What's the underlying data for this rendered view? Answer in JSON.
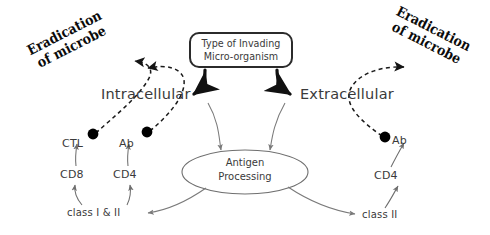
{
  "diagram": {
    "title_box": {
      "line1": "Type of Invading",
      "line2": "Micro-organism"
    },
    "branches": {
      "left_label": "Intracellular",
      "right_label": "Extracellular"
    },
    "processing_node": {
      "line1": "Antigen",
      "line2": "Processing"
    },
    "outcomes": {
      "left_line1": "Eradication",
      "left_line2": "of microbe",
      "right_line1": "Eradication",
      "right_line2": "of microbe"
    },
    "left_chain": {
      "effector_1": "CTL",
      "effector_2": "Ab",
      "receptor_1": "CD8",
      "receptor_2": "CD4",
      "mhc": "class I & II"
    },
    "right_chain": {
      "effector_1": "Ab",
      "receptor_1": "CD4",
      "mhc": "class II"
    },
    "colors": {
      "ink": "#3a3a3a",
      "bold_ink": "#0b0b0b",
      "thin_arrow": "#7a7a7a",
      "thick_arrow": "#111111",
      "dashed_arrow": "#1a1a1a",
      "dot": "#000000",
      "background": "#ffffff"
    }
  }
}
